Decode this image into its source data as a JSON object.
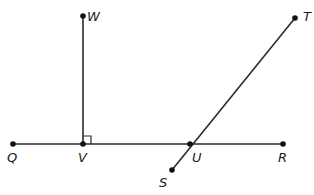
{
  "diagram": {
    "type": "geometry",
    "stroke_color": "#2b2b2b",
    "point_color": "#111111",
    "points": {
      "Q": {
        "label": "Q",
        "x": 13,
        "y": 144
      },
      "V": {
        "label": "V",
        "x": 83,
        "y": 144
      },
      "U": {
        "label": "U",
        "x": 190,
        "y": 144
      },
      "R": {
        "label": "R",
        "x": 283,
        "y": 144
      },
      "W": {
        "label": "W",
        "x": 83,
        "y": 16
      },
      "T": {
        "label": "T",
        "x": 295,
        "y": 18
      },
      "S": {
        "label": "S",
        "x": 172,
        "y": 170
      }
    },
    "segments": [
      {
        "from": "Q",
        "to": "R"
      },
      {
        "from": "V",
        "to": "W"
      },
      {
        "from": "S",
        "to": "T"
      }
    ],
    "right_angles": [
      {
        "vertex": "V",
        "between": [
          "W",
          "R"
        ]
      }
    ]
  }
}
